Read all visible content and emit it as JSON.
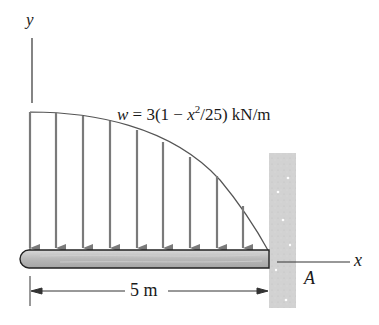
{
  "diagram": {
    "type": "cantilever-beam-distributed-load",
    "axes": {
      "y_label": "y",
      "x_label": "x"
    },
    "load": {
      "symbol": "w",
      "equation_prefix": "= 3(1 − ",
      "equation_var": "x",
      "equation_exp": "2",
      "equation_suffix": "/25) kN/m",
      "arrow_count": 9,
      "shape": "parabolic, max at free end, zero at wall"
    },
    "support": {
      "type": "fixed wall",
      "label": "A"
    },
    "dimension": {
      "label": "5 m"
    },
    "colors": {
      "line": "#333333",
      "arrow": "#7a7a7a",
      "beam_fill": "#bdbdbd",
      "wall_fill": "#d4d4d4"
    }
  }
}
